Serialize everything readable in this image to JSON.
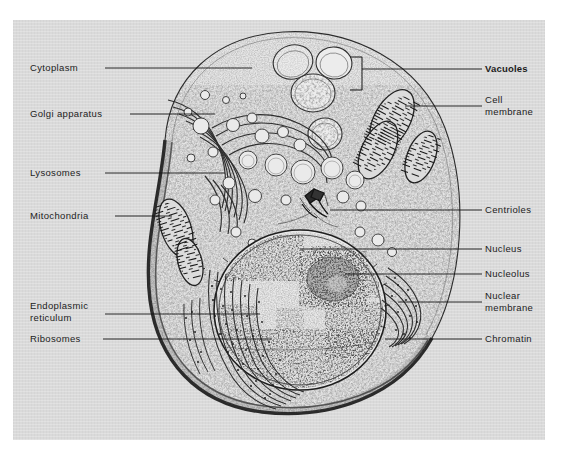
{
  "figure": {
    "kind": "scanned-diagram",
    "background_color": "#d9d9d9",
    "page_color": "#ffffff",
    "ink_color": "#1c1c1c"
  },
  "labels_left": [
    {
      "id": "cytoplasm",
      "text": "Cytoplasm",
      "x": 30,
      "y": 62,
      "line": {
        "x1": 105,
        "y1": 68,
        "x2": 252,
        "y2": 68
      }
    },
    {
      "id": "golgi",
      "text": "Golgi apparatus",
      "x": 30,
      "y": 108,
      "line": {
        "x1": 130,
        "y1": 114,
        "x2": 215,
        "y2": 114
      }
    },
    {
      "id": "lysosomes",
      "text": "Lysosomes",
      "x": 30,
      "y": 167,
      "line": {
        "x1": 105,
        "y1": 173,
        "x2": 225,
        "y2": 173
      }
    },
    {
      "id": "mitochondria",
      "text": "Mitochondria",
      "x": 30,
      "y": 210,
      "line": {
        "x1": 115,
        "y1": 216,
        "x2": 172,
        "y2": 216
      }
    },
    {
      "id": "endoplasmic-reticulum",
      "text": "Endoplasmic",
      "text2": "reticulum",
      "x": 30,
      "y": 300,
      "line": {
        "x1": 105,
        "y1": 314,
        "x2": 260,
        "y2": 314
      }
    },
    {
      "id": "ribosomes",
      "text": "Ribosomes",
      "x": 30,
      "y": 333,
      "line": {
        "x1": 103,
        "y1": 339,
        "x2": 272,
        "y2": 339
      }
    }
  ],
  "labels_right": [
    {
      "id": "vacuoles",
      "text": "Vacuoles",
      "bold": true,
      "x": 485,
      "y": 63,
      "line": {
        "x1": 362,
        "y1": 69,
        "x2": 482,
        "y2": 69
      }
    },
    {
      "id": "cell-membrane",
      "text": "Cell",
      "text2": "membrane",
      "x": 485,
      "y": 94,
      "line": {
        "x1": 405,
        "y1": 106,
        "x2": 482,
        "y2": 106
      }
    },
    {
      "id": "centrioles",
      "text": "Centrioles",
      "x": 485,
      "y": 204,
      "line": {
        "x1": 330,
        "y1": 210,
        "x2": 482,
        "y2": 210
      }
    },
    {
      "id": "nucleus",
      "text": "Nucleus",
      "x": 485,
      "y": 243,
      "line": {
        "x1": 300,
        "y1": 249,
        "x2": 482,
        "y2": 249
      }
    },
    {
      "id": "nucleolus",
      "text": "Nucleolus",
      "x": 485,
      "y": 268,
      "line": {
        "x1": 345,
        "y1": 274,
        "x2": 482,
        "y2": 274
      }
    },
    {
      "id": "nuclear-membrane",
      "text": "Nuclear",
      "text2": "membrane",
      "x": 485,
      "y": 290,
      "line": {
        "x1": 398,
        "y1": 302,
        "x2": 482,
        "y2": 302
      }
    },
    {
      "id": "chromatin",
      "text": "Chromatin",
      "x": 485,
      "y": 333,
      "line": {
        "x1": 385,
        "y1": 339,
        "x2": 482,
        "y2": 339
      }
    }
  ],
  "bracket": {
    "id": "vacuoles-bracket",
    "x": 362,
    "y_top": 62,
    "y_bottom": 90,
    "arm": 12
  }
}
